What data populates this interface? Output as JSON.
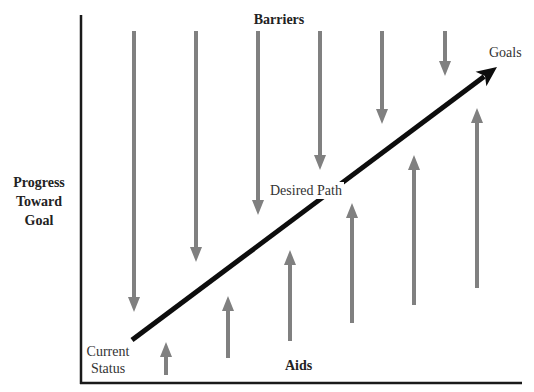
{
  "chart_data": {
    "type": "diagram",
    "ylabel": "Progress Toward Goal",
    "top_label": "Barriers",
    "bottom_label": "Aids",
    "path": {
      "label": "Desired Path",
      "start_label": "Current Status",
      "end_label": "Goals",
      "start": [
        132,
        340
      ],
      "end": [
        497,
        67
      ]
    },
    "barriers": [
      {
        "x": 134,
        "top": 31,
        "bottom": 312
      },
      {
        "x": 196,
        "top": 31,
        "bottom": 262
      },
      {
        "x": 258,
        "top": 31,
        "bottom": 215
      },
      {
        "x": 320,
        "top": 31,
        "bottom": 170
      },
      {
        "x": 382,
        "top": 31,
        "bottom": 124
      },
      {
        "x": 445,
        "top": 31,
        "bottom": 76
      }
    ],
    "aids": [
      {
        "x": 166,
        "bottom": 375,
        "top": 342
      },
      {
        "x": 228,
        "bottom": 358,
        "top": 296
      },
      {
        "x": 290,
        "bottom": 341,
        "top": 250
      },
      {
        "x": 352,
        "bottom": 323,
        "top": 203
      },
      {
        "x": 414,
        "bottom": 305,
        "top": 155
      },
      {
        "x": 477,
        "bottom": 288,
        "top": 108
      }
    ],
    "colors": {
      "axis": "#1a1a1a",
      "force_arrow": "#808080",
      "path_arrow": "#0d0d0d"
    }
  },
  "labels": {
    "barriers": "Barriers",
    "goals": "Goals",
    "desired_path": "Desired Path",
    "current_line1": "Current",
    "current_line2": "Status",
    "aids": "Aids",
    "yaxis_line1": "Progress",
    "yaxis_line2": "Toward",
    "yaxis_line3": "Goal"
  }
}
